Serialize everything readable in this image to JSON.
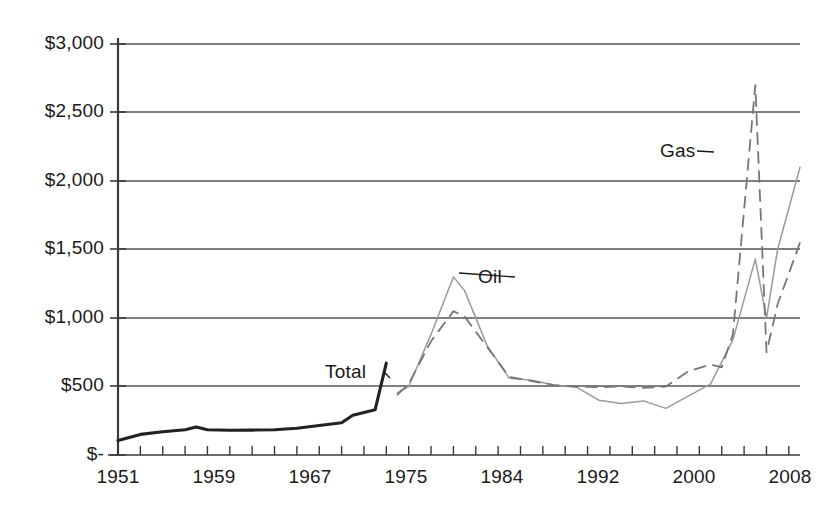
{
  "chart_data": {
    "type": "line",
    "title": "",
    "subtitle": "",
    "xlabel": "",
    "ylabel": "",
    "grid": true,
    "legend_position": "inline-annotations",
    "xlim": [
      1951,
      2012
    ],
    "ylim": [
      0,
      3000
    ],
    "y_ticks": [
      0,
      500,
      1000,
      1500,
      2000,
      2500,
      3000
    ],
    "y_tick_labels": [
      "$-",
      "$500",
      "$1,000",
      "$1,500",
      "$2,000",
      "$2,500",
      "$3,000"
    ],
    "x_tick_labels": [
      "1951",
      "1959",
      "1967",
      "1975",
      "1984",
      "1992",
      "2000",
      "2008"
    ],
    "x_tick_label_values": [
      1951,
      1959,
      1967,
      1975,
      1984,
      1992,
      2000,
      2008
    ],
    "x_minor_tick_interval": 2,
    "series": [
      {
        "name": "Total",
        "style": "solid-thick-black",
        "color": "#222222",
        "x": [
          1951,
          1953,
          1955,
          1957,
          1958,
          1959,
          1961,
          1963,
          1965,
          1967,
          1969,
          1971,
          1972,
          1973,
          1974,
          1975
        ],
        "values": [
          105,
          150,
          170,
          185,
          205,
          185,
          180,
          182,
          185,
          195,
          215,
          235,
          290,
          310,
          330,
          670
        ]
      },
      {
        "name": "Oil",
        "style": "solid-thin-gray",
        "color": "#9a9a9a",
        "x": [
          1976,
          1977,
          1979,
          1981,
          1982,
          1984,
          1986,
          1988,
          1990,
          1992,
          1994,
          1996,
          1998,
          2000,
          2002,
          2004,
          2006,
          2008,
          2009,
          2010,
          2012
        ],
        "values": [
          455,
          500,
          880,
          1300,
          1200,
          800,
          560,
          545,
          510,
          495,
          400,
          375,
          395,
          340,
          430,
          520,
          840,
          1430,
          1000,
          1500,
          2100
        ]
      },
      {
        "name": "Gas",
        "style": "dashed-gray",
        "color": "#777777",
        "x": [
          1976,
          1977,
          1979,
          1981,
          1982,
          1984,
          1986,
          1988,
          1990,
          1992,
          1994,
          1996,
          1998,
          2000,
          2002,
          2004,
          2005,
          2006,
          2008,
          2009,
          2010,
          2012
        ],
        "values": [
          440,
          520,
          830,
          1050,
          1010,
          790,
          570,
          540,
          510,
          500,
          495,
          500,
          490,
          500,
          610,
          660,
          640,
          880,
          2700,
          750,
          1100,
          1550
        ]
      }
    ],
    "annotations": [
      {
        "name": "Total",
        "label": "Total",
        "label_x": 325,
        "label_y": 361,
        "leader_to_x": 390,
        "leader_to_y": 378
      },
      {
        "name": "Oil",
        "label": "Oil",
        "label_x": 478,
        "label_y": 266,
        "leader_to_x": 459,
        "leader_to_y": 273
      },
      {
        "name": "Gas",
        "label": "Gas",
        "label_x": 660,
        "label_y": 140,
        "leader_to_x": 714,
        "leader_to_y": 152
      }
    ]
  },
  "axes": {
    "y_labels": [
      {
        "text": "$3,000",
        "y": 44
      },
      {
        "text": "$2,500",
        "y": 112
      },
      {
        "text": "$2,000",
        "y": 181
      },
      {
        "text": "$1,500",
        "y": 249
      },
      {
        "text": "$1,000",
        "y": 318
      },
      {
        "text": "$500",
        "y": 386
      },
      {
        "text": "$-",
        "y": 455
      }
    ],
    "x_labels": [
      {
        "text": "1951",
        "x": 118
      },
      {
        "text": "1959",
        "x": 214
      },
      {
        "text": "1967",
        "x": 310
      },
      {
        "text": "1975",
        "x": 406
      },
      {
        "text": "1984",
        "x": 502
      },
      {
        "text": "1992",
        "x": 598
      },
      {
        "text": "2000",
        "x": 694
      },
      {
        "text": "2008",
        "x": 790
      }
    ]
  },
  "colors": {
    "axis": "#3a3a3a",
    "grid": "#555555",
    "total": "#222222",
    "oil": "#9a9a9a",
    "gas": "#777777",
    "background": "#ffffff"
  }
}
